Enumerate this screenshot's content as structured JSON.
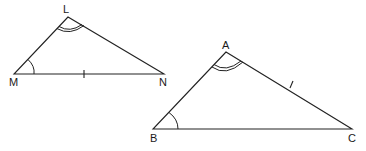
{
  "diagram": {
    "type": "similar-triangles",
    "triangles": [
      {
        "name": "LMN",
        "vertices": {
          "L": {
            "label": "L",
            "x": 68,
            "y": 17
          },
          "M": {
            "label": "M",
            "x": 14,
            "y": 74
          },
          "N": {
            "label": "N",
            "x": 164,
            "y": 74
          }
        },
        "angle_marks": [
          {
            "vertex": "L",
            "arcs": 2
          },
          {
            "vertex": "M",
            "arcs": 1
          }
        ],
        "tick_marks": [
          {
            "side": "MN",
            "ticks": 1
          }
        ]
      },
      {
        "name": "ABC",
        "vertices": {
          "A": {
            "label": "A",
            "x": 226,
            "y": 52
          },
          "B": {
            "label": "B",
            "x": 153,
            "y": 129
          },
          "C": {
            "label": "C",
            "x": 352,
            "y": 129
          }
        },
        "angle_marks": [
          {
            "vertex": "A",
            "arcs": 2
          },
          {
            "vertex": "B",
            "arcs": 1
          }
        ],
        "tick_marks": [
          {
            "side": "AC",
            "ticks": 1
          }
        ]
      }
    ],
    "stroke_color": "#222222",
    "background": "#ffffff"
  }
}
